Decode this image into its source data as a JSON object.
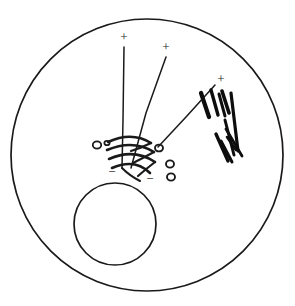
{
  "figure": {
    "background_color": "#ffffff",
    "ink_color": "#1a1a1a",
    "hatch_color": "#0d0d0d",
    "width": 295,
    "height": 306
  },
  "labels": {
    "plus_1": "+",
    "plus_2": "+",
    "plus_3": "+",
    "minus_1": "−",
    "minus_2": "−"
  },
  "annotations": [
    {
      "name": "charge-label-plus-1",
      "text": "+",
      "x": 124,
      "y": 38,
      "size": 13
    },
    {
      "name": "charge-label-plus-2",
      "text": "+",
      "x": 166,
      "y": 48,
      "size": 13
    },
    {
      "name": "charge-label-plus-3",
      "text": "+",
      "x": 221,
      "y": 80,
      "size": 13
    },
    {
      "name": "charge-label-minus-1",
      "text": "−",
      "x": 112,
      "y": 173,
      "size": 13
    },
    {
      "name": "charge-label-minus-2",
      "text": "−",
      "x": 150,
      "y": 180,
      "size": 13
    }
  ],
  "shapes": {
    "outer_boundary_circle": {
      "cx": 147,
      "cy": 155,
      "r": 136,
      "stroke_width": 1.7
    },
    "inner_target_circle": {
      "cx": 115,
      "cy": 224,
      "r": 41,
      "stroke_width": 1.7
    }
  },
  "tracks": [
    {
      "name": "track-1",
      "path": "M 124,47 L 123,120 L 122,168",
      "stroke_width": 1.5
    },
    {
      "name": "track-2",
      "path": "M 166,57 L 146,113 L 131,168",
      "stroke_width": 1.5
    },
    {
      "name": "track-3",
      "path": "M 215,85 L 186,117 L 158,147",
      "stroke_width": 1.5
    }
  ],
  "spiral_arcs": [
    {
      "name": "spiral-arc-1",
      "path": "M 108,142 Q 132,131 151,143",
      "stroke_width": 2.6
    },
    {
      "name": "spiral-arc-2",
      "path": "M 107,150 Q 133,139 154,152",
      "stroke_width": 2.6
    },
    {
      "name": "spiral-arc-3",
      "path": "M 109,159 Q 134,148 155,162",
      "stroke_width": 2.6
    },
    {
      "name": "spiral-arc-4",
      "path": "M 112,168 Q 135,158 150,173",
      "stroke_width": 2.6
    },
    {
      "name": "spiral-connector-1",
      "path": "M 151,143 Q 141,148 131,151",
      "stroke_width": 2.2
    },
    {
      "name": "spiral-connector-2",
      "path": "M 154,152 Q 143,158 133,163",
      "stroke_width": 2.2
    },
    {
      "name": "spiral-connector-3",
      "path": "M 155,162 Q 146,169 138,176",
      "stroke_width": 2.2
    },
    {
      "name": "spiral-tail",
      "path": "M 122,168 Q 130,176 140,181",
      "stroke_width": 2.0
    }
  ],
  "bubbles": [
    {
      "name": "bubble-1",
      "cx": 97,
      "cy": 145,
      "rx": 4.2,
      "ry": 3.6,
      "stroke_width": 1.8
    },
    {
      "name": "bubble-2",
      "cx": 107,
      "cy": 143,
      "rx": 2.6,
      "ry": 2.2,
      "stroke_width": 1.8
    },
    {
      "name": "bubble-3",
      "cx": 159,
      "cy": 148,
      "rx": 4.0,
      "ry": 3.4,
      "stroke_width": 1.9
    },
    {
      "name": "bubble-4",
      "cx": 170,
      "cy": 164,
      "rx": 4.0,
      "ry": 3.6,
      "stroke_width": 1.9
    },
    {
      "name": "bubble-5",
      "cx": 171,
      "cy": 177,
      "rx": 4.0,
      "ry": 3.6,
      "stroke_width": 1.9
    }
  ],
  "hatch_marks": [
    {
      "name": "hatch-mark-1",
      "path": "M 201,93 L 209,117",
      "stroke_width": 4.2
    },
    {
      "name": "hatch-mark-2",
      "path": "M 211,90 L 218,115",
      "stroke_width": 3.4
    },
    {
      "name": "hatch-mark-3",
      "path": "M 219,94 L 225,116",
      "stroke_width": 3.0
    },
    {
      "name": "hatch-mark-4",
      "path": "M 222,91 L 229,113",
      "stroke_width": 3.6
    },
    {
      "name": "hatch-mark-5",
      "path": "M 231,93 L 238,151",
      "stroke_width": 3.2
    },
    {
      "name": "hatch-mark-6",
      "path": "M 225,120 L 234,155",
      "stroke_width": 3.0
    },
    {
      "name": "hatch-mark-7",
      "path": "M 216,134 L 228,161",
      "stroke_width": 3.4
    },
    {
      "name": "hatch-mark-8",
      "path": "M 226,129 L 242,156",
      "stroke_width": 2.8
    },
    {
      "name": "hatch-mark-9",
      "path": "M 221,141 L 232,162",
      "stroke_width": 3.0
    },
    {
      "name": "hatch-mark-10",
      "path": "M 227,137 L 236,150",
      "stroke_width": 2.6
    }
  ]
}
